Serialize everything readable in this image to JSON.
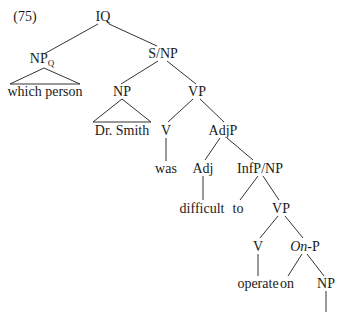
{
  "example_number": "(75)",
  "nodes": {
    "iq": {
      "label": "IQ"
    },
    "npq": {
      "label": "NP",
      "sub": "Q"
    },
    "which_person": {
      "label": "which person"
    },
    "s_np": {
      "label": "S/NP"
    },
    "np_subj": {
      "label": "NP"
    },
    "dr_smith": {
      "label": "Dr. Smith"
    },
    "vp1": {
      "label": "VP"
    },
    "v1": {
      "label": "V"
    },
    "was": {
      "label": "was"
    },
    "adjp": {
      "label": "AdjP"
    },
    "adj": {
      "label": "Adj"
    },
    "difficult": {
      "label": "difficult"
    },
    "infp_np": {
      "label": "InfP/NP"
    },
    "to": {
      "label": "to"
    },
    "vp2": {
      "label": "VP"
    },
    "v2": {
      "label": "V"
    },
    "operate": {
      "label": "operate"
    },
    "onp": {
      "label_italic": "On",
      "label_rest": "-P"
    },
    "on": {
      "label": "on"
    },
    "np_obj": {
      "label": "NP"
    }
  },
  "colors": {
    "line": "#333333",
    "text": "#1a1a1a",
    "background": "#ffffff"
  }
}
